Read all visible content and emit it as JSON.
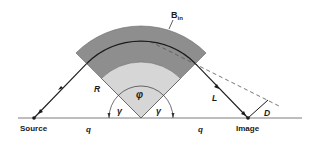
{
  "diagram": {
    "type": "magnet-optics-geometry",
    "labels": {
      "field": "B",
      "field_sub": "in",
      "radius": "R",
      "length": "L",
      "distance": "D",
      "bend_angle": "φ",
      "edge_angle_left": "γ",
      "edge_angle_right": "γ",
      "q_left": "q",
      "q_right": "q",
      "source": "Source",
      "image": "Image"
    },
    "colors": {
      "outer_band": "#8e8e8e",
      "inner_region": "#d6d6d6",
      "line": "#1a1a1a",
      "baseline": "#6e6e6e",
      "dashed": "#555555"
    },
    "geometry": {
      "center": [
        141,
        118
      ],
      "outer_radius": 92,
      "path_radius": 77,
      "inner_radius": 56,
      "angle_arc_radius": 32,
      "sector_start_deg": 45,
      "sector_end_deg": 135,
      "source_point": [
        34,
        118
      ],
      "image_point": [
        248,
        118
      ],
      "baseline": [
        18,
        302
      ]
    }
  }
}
